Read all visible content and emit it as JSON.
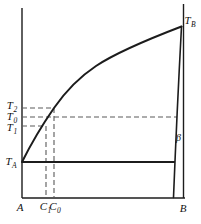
{
  "colors": {
    "background": "#ffffff",
    "line": "#1c1c1c",
    "dash_line": "#5a5a5a",
    "text": "#111111"
  },
  "labels": {
    "tb": {
      "base": "T",
      "sub": "B"
    },
    "t2": {
      "base": "T",
      "sub": "2"
    },
    "t0": {
      "base": "T",
      "sub": "0"
    },
    "t1": {
      "base": "T",
      "sub": "1"
    },
    "ta": {
      "base": "T",
      "sub": "A"
    },
    "beta": "β",
    "a": "A",
    "c1": {
      "base": "C",
      "sub": "1"
    },
    "c0": {
      "base": "C",
      "sub": "0"
    },
    "b": "B"
  }
}
